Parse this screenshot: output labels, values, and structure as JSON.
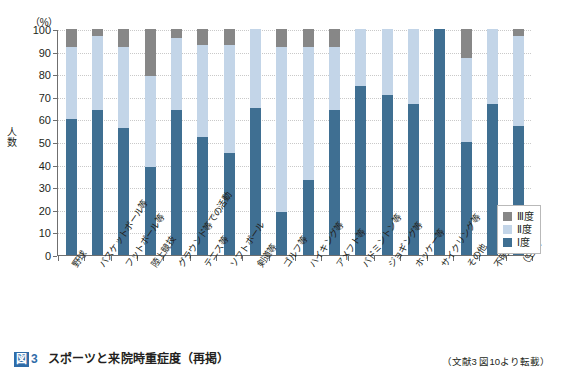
{
  "figure": {
    "badge": "図",
    "number": "3",
    "title": "スポーツと来院時重症度（再掲）",
    "source": "（文献3 図10より転載）"
  },
  "axis": {
    "unit_label": "（%）",
    "y_title": "人数",
    "y_ticks": [
      "100",
      "90",
      "80",
      "70",
      "60",
      "50",
      "40",
      "30",
      "20",
      "10",
      "0"
    ]
  },
  "legend": {
    "position": "inside-right-lower",
    "items": [
      {
        "label": "Ⅲ度",
        "color": "#878787",
        "name": "legend-item-iii"
      },
      {
        "label": "Ⅱ度",
        "color": "#c3d5e8",
        "name": "legend-item-ii"
      },
      {
        "label": "Ⅰ度",
        "color": "#3f6f92",
        "name": "legend-item-i"
      }
    ]
  },
  "colors": {
    "grade_i": "#3f6f92",
    "grade_ii": "#c3d5e8",
    "grade_iii": "#878787",
    "axis": "#6f6f6f",
    "grid": "#c9c9c9",
    "caption_accent": "#2f6ca8"
  },
  "chart_data": {
    "type": "bar",
    "subtype": "stacked-100-percent",
    "title": "スポーツと来院時重症度（再掲）",
    "xlabel": "",
    "ylabel": "人数",
    "unit": "%",
    "ylim": [
      0,
      100
    ],
    "ytick_step": 10,
    "grid": true,
    "legend_position": "inside right lower",
    "categories": [
      "野球",
      "バスケットボール等",
      "フットボール等",
      "陸上競技",
      "グラウンド等での活動",
      "テニス等",
      "ソフトボール",
      "剣道等",
      "ゴルフ等",
      "ハイキング等",
      "アメフト等",
      "バドミントン等",
      "ジョギング等",
      "ホッケー等",
      "サイクリング等",
      "その他",
      "不明",
      "（空白）"
    ],
    "series": [
      {
        "name": "Ⅰ度",
        "color": "#3f6f92",
        "values": [
          60,
          64,
          56,
          39,
          64,
          52,
          45,
          65,
          19,
          33,
          64,
          75,
          71,
          67,
          100,
          50,
          67,
          57
        ]
      },
      {
        "name": "Ⅱ度",
        "color": "#c3d5e8",
        "values": [
          32,
          33,
          36,
          40,
          32,
          41,
          48,
          35,
          73,
          59,
          28,
          25,
          29,
          33,
          0,
          37,
          33,
          40
        ]
      },
      {
        "name": "Ⅲ度",
        "color": "#878787",
        "values": [
          8,
          3,
          8,
          21,
          4,
          7,
          7,
          0,
          8,
          8,
          8,
          0,
          0,
          0,
          0,
          13,
          0,
          3
        ]
      }
    ]
  }
}
